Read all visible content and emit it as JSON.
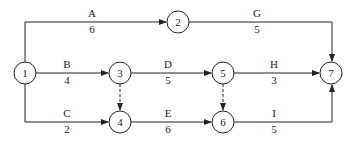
{
  "diagram": {
    "type": "activity-on-arrow network",
    "nodes": [
      {
        "id": "1",
        "label": "1"
      },
      {
        "id": "2",
        "label": "2"
      },
      {
        "id": "3",
        "label": "3"
      },
      {
        "id": "4",
        "label": "4"
      },
      {
        "id": "5",
        "label": "5"
      },
      {
        "id": "6",
        "label": "6"
      },
      {
        "id": "7",
        "label": "7"
      }
    ],
    "activities": [
      {
        "name": "A",
        "duration": "6",
        "from": "1",
        "to": "2"
      },
      {
        "name": "B",
        "duration": "4",
        "from": "1",
        "to": "3"
      },
      {
        "name": "C",
        "duration": "2",
        "from": "1",
        "to": "4"
      },
      {
        "name": "D",
        "duration": "5",
        "from": "3",
        "to": "5"
      },
      {
        "name": "E",
        "duration": "6",
        "from": "4",
        "to": "6"
      },
      {
        "name": "G",
        "duration": "5",
        "from": "2",
        "to": "7"
      },
      {
        "name": "H",
        "duration": "3",
        "from": "5",
        "to": "7"
      },
      {
        "name": "I",
        "duration": "5",
        "from": "6",
        "to": "7"
      }
    ],
    "dummy_activities": [
      {
        "from": "3",
        "to": "4"
      },
      {
        "from": "5",
        "to": "6"
      }
    ]
  }
}
